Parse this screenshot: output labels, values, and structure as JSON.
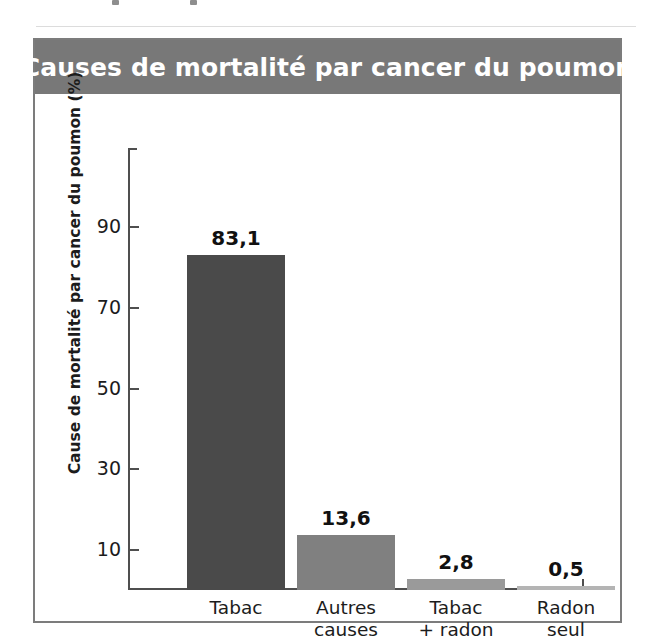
{
  "figure": {
    "title": "Causes de mortalité par cancer du poumon",
    "title_banner_color": "#787878",
    "frame_color": "#7c7c7c",
    "background": "#ffffff"
  },
  "chart_data": {
    "type": "bar",
    "title": "Causes de mortalité par cancer du poumon",
    "xlabel": "",
    "ylabel": "Cause de mortalité par cancer du poumon (%)",
    "categories": [
      "Tabac",
      "Autres\ncauses",
      "Tabac\n+ radon",
      "Radon\nseul"
    ],
    "values": [
      83.1,
      13.6,
      2.8,
      0.5
    ],
    "value_labels": [
      "83,1",
      "13,6",
      "2,8",
      "0,5"
    ],
    "bar_colors": [
      "#4a4a4a",
      "#808080",
      "#9a9a9a",
      "#b4b4b4"
    ],
    "ylim": [
      0,
      90
    ],
    "yticks": [
      90,
      70,
      50,
      30,
      10
    ],
    "ytick_labels": [
      "90",
      "70",
      "50",
      "30",
      "10"
    ],
    "grid": false,
    "legend": null,
    "units": "%",
    "decimal_separator": ","
  }
}
